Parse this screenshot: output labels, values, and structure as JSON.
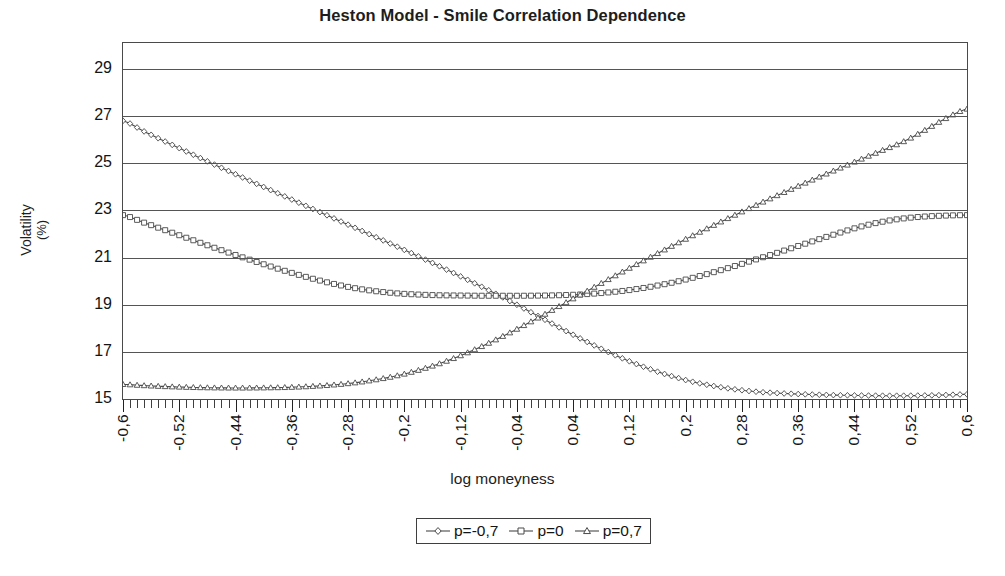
{
  "chart_data": {
    "type": "line",
    "title": "Heston Model - Smile Correlation Dependence",
    "xlabel": "log moneyness",
    "ylabel": "Volatility (%)",
    "ylabel_line1": "Volatility",
    "ylabel_line2": "(%)",
    "xlim": [
      -0.6,
      0.6
    ],
    "ylim": [
      15,
      30.1
    ],
    "grid": "horizontal",
    "yticks": [
      15,
      17,
      19,
      21,
      23,
      25,
      27,
      29
    ],
    "ytick_labels": [
      "15",
      "17",
      "19",
      "21",
      "23",
      "25",
      "27",
      "29"
    ],
    "xticks": [
      -0.6,
      -0.52,
      -0.44,
      -0.36,
      -0.28,
      -0.2,
      -0.12,
      -0.04,
      0.04,
      0.12,
      0.2,
      0.28,
      0.36,
      0.44,
      0.52,
      0.6
    ],
    "xtick_labels": [
      "-0,6",
      "-0,52",
      "-0,44",
      "-0,36",
      "-0,28",
      "-0,2",
      "-0,12",
      "-0,04",
      "0,04",
      "0,12",
      "0,2",
      "0,28",
      "0,36",
      "0,44",
      "0,52",
      "0,6"
    ],
    "xtick_minor_step": 0.01,
    "decimal_separator": ",",
    "legend_position": "bottom-center",
    "line_color": "#4a4a4a",
    "x": [
      -0.6,
      -0.57,
      -0.54,
      -0.51,
      -0.48,
      -0.45,
      -0.42,
      -0.39,
      -0.36,
      -0.33,
      -0.3,
      -0.27,
      -0.24,
      -0.21,
      -0.18,
      -0.15,
      -0.12,
      -0.09,
      -0.06,
      -0.03,
      0.0,
      0.03,
      0.06,
      0.09,
      0.12,
      0.15,
      0.18,
      0.21,
      0.24,
      0.27,
      0.3,
      0.33,
      0.36,
      0.39,
      0.42,
      0.45,
      0.48,
      0.51,
      0.54,
      0.57,
      0.6
    ],
    "series": [
      {
        "name": "p=−0,7",
        "label": "p=-0,7",
        "marker": "diamond",
        "values": [
          26.8,
          26.35,
          25.92,
          25.5,
          25.08,
          24.67,
          24.26,
          23.86,
          23.46,
          23.06,
          22.66,
          22.26,
          21.86,
          21.46,
          21.05,
          20.63,
          20.2,
          19.76,
          19.31,
          18.84,
          18.36,
          17.88,
          17.42,
          16.99,
          16.6,
          16.26,
          15.97,
          15.73,
          15.55,
          15.41,
          15.31,
          15.25,
          15.21,
          15.18,
          15.16,
          15.15,
          15.14,
          15.14,
          15.15,
          15.17,
          15.2
        ]
      },
      {
        "name": "p=0",
        "label": "p=0",
        "marker": "square",
        "values": [
          22.8,
          22.48,
          22.16,
          21.84,
          21.52,
          21.21,
          20.91,
          20.62,
          20.35,
          20.1,
          19.88,
          19.7,
          19.57,
          19.48,
          19.43,
          19.4,
          19.39,
          19.38,
          19.38,
          19.38,
          19.39,
          19.41,
          19.45,
          19.52,
          19.62,
          19.76,
          19.93,
          20.14,
          20.38,
          20.64,
          20.92,
          21.2,
          21.49,
          21.78,
          22.06,
          22.32,
          22.52,
          22.66,
          22.74,
          22.78,
          22.8
        ]
      },
      {
        "name": "p=0,7",
        "label": "p=0,7",
        "marker": "triangle",
        "values": [
          15.62,
          15.57,
          15.53,
          15.5,
          15.48,
          15.47,
          15.47,
          15.48,
          15.5,
          15.54,
          15.6,
          15.69,
          15.82,
          15.99,
          16.22,
          16.5,
          16.84,
          17.23,
          17.66,
          18.12,
          18.6,
          19.09,
          19.58,
          20.07,
          20.55,
          21.02,
          21.48,
          21.93,
          22.37,
          22.8,
          23.22,
          23.63,
          24.03,
          24.42,
          24.8,
          25.18,
          25.55,
          25.92,
          26.4,
          26.9,
          27.3
        ]
      }
    ]
  },
  "legend": {
    "items": [
      {
        "label": "p=-0,7",
        "marker": "diamond"
      },
      {
        "label": "p=0",
        "marker": "square"
      },
      {
        "label": "p=0,7",
        "marker": "triangle"
      }
    ]
  }
}
